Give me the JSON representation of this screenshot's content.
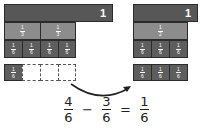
{
  "left": {
    "whole_label": "1",
    "row_middle": [
      {
        "num": "1",
        "den": "3"
      },
      {
        "num": "1",
        "den": "3"
      }
    ],
    "row_sixths": [
      {
        "num": "1",
        "den": "6"
      },
      {
        "num": "1",
        "den": "6"
      },
      {
        "num": "1",
        "den": "6"
      },
      {
        "num": "1",
        "den": "6"
      }
    ],
    "remaining": [
      {
        "num": "1",
        "den": "6"
      }
    ]
  },
  "right": {
    "whole_label": "1",
    "row_middle": [
      {
        "num": "1",
        "den": "2"
      }
    ],
    "row_sixths": [
      {
        "num": "1",
        "den": "6"
      },
      {
        "num": "1",
        "den": "6"
      },
      {
        "num": "1",
        "den": "6"
      }
    ],
    "moved": [
      {
        "num": "1",
        "den": "6"
      },
      {
        "num": "1",
        "den": "6"
      },
      {
        "num": "1",
        "den": "6"
      }
    ]
  },
  "equation": {
    "a": {
      "num": "4",
      "den": "6"
    },
    "op1": "−",
    "b": {
      "num": "3",
      "den": "6"
    },
    "op2": "=",
    "c": {
      "num": "1",
      "den": "6"
    }
  },
  "colors": {
    "whole": "#575757",
    "middle": "#8c8c8c",
    "sixth": "#5e5e5e"
  }
}
